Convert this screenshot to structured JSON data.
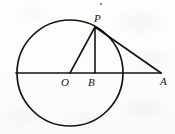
{
  "figure": {
    "stroke_color": "#141418",
    "background_color": "#fdfdfc",
    "width": 175,
    "height": 134,
    "stroke_width": 1.6
  },
  "labels": {
    "P": "P",
    "O": "O",
    "B": "B",
    "A": "A"
  },
  "points": {
    "O": {
      "name": "O",
      "x": 70,
      "y": 73,
      "role": "circle-center"
    },
    "P": {
      "name": "P",
      "x": 95,
      "y": 27,
      "role": "point-on-circle"
    },
    "B": {
      "name": "B",
      "x": 95,
      "y": 73,
      "role": "foot-of-perpendicular"
    },
    "A": {
      "name": "A",
      "x": 161,
      "y": 73,
      "role": "external-point"
    },
    "left_end": {
      "name": "left-diameter-end",
      "x": 16,
      "y": 73
    },
    "right_arc": {
      "name": "right-diameter-end",
      "x": 124,
      "y": 73
    }
  },
  "circle": {
    "center_x": 70,
    "center_y": 73,
    "radius": 53
  },
  "segments": [
    {
      "name": "diameter-line",
      "from": "left_end",
      "to": "A",
      "x1": 16,
      "y1": 73,
      "x2": 161,
      "y2": 73
    },
    {
      "name": "radius-OP",
      "from": "O",
      "to": "P",
      "x1": 70,
      "y1": 73,
      "x2": 95,
      "y2": 27
    },
    {
      "name": "perpendicular-PB",
      "from": "P",
      "to": "B",
      "x1": 95,
      "y1": 27,
      "x2": 95,
      "y2": 73
    },
    {
      "name": "tangent-PA",
      "from": "P",
      "to": "A",
      "x1": 95,
      "y1": 27,
      "x2": 161,
      "y2": 73
    }
  ],
  "marks": {
    "speck": "ink-speck"
  }
}
